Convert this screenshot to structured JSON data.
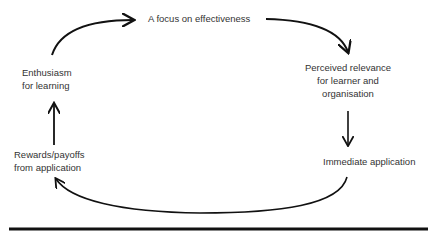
{
  "diagram": {
    "type": "cycle",
    "nodes": [
      {
        "id": "focus",
        "lines": [
          "A focus on effectiveness"
        ]
      },
      {
        "id": "relevance",
        "lines": [
          "Perceived relevance",
          "for learner and",
          "organisation"
        ]
      },
      {
        "id": "application",
        "lines": [
          "Immediate application"
        ]
      },
      {
        "id": "rewards",
        "lines": [
          "Rewards/payoffs",
          "from application"
        ]
      },
      {
        "id": "enthusiasm",
        "lines": [
          "Enthusiasm",
          "for learning"
        ]
      }
    ],
    "edges": [
      {
        "from": "enthusiasm",
        "to": "focus"
      },
      {
        "from": "focus",
        "to": "relevance"
      },
      {
        "from": "relevance",
        "to": "application"
      },
      {
        "from": "application",
        "to": "rewards"
      },
      {
        "from": "rewards",
        "to": "enthusiasm"
      }
    ],
    "colors": {
      "text": "#333333",
      "line": "#111111"
    }
  }
}
